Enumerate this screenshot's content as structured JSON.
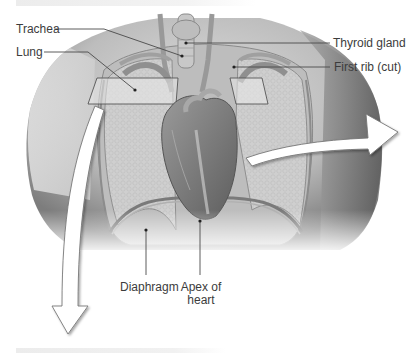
{
  "figure": {
    "labels": {
      "trachea": "Trachea",
      "lung": "Lung",
      "thyroid_gland": "Thyroid gland",
      "first_rib": "First rib (cut)",
      "diaphragm": "Diaphragm",
      "apex_of_heart_line1": "Apex of",
      "apex_of_heart_line2": "heart"
    },
    "arrows": [
      {
        "name": "right-arrow",
        "direction": "right"
      },
      {
        "name": "down-arrow",
        "direction": "down"
      }
    ],
    "colors": {
      "skin_dark": "#6e6e6e",
      "skin_light": "#d8d8d8",
      "lung": "#c9c9c9",
      "heart": "#7a7a7a",
      "leader_line": "#4a4a4a",
      "label_text": "#3c3c3c"
    }
  }
}
